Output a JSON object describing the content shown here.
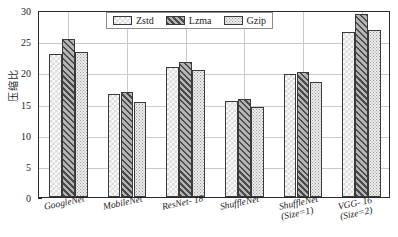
{
  "chart_data": {
    "type": "bar",
    "title": "",
    "xlabel": "",
    "ylabel": "压缩比",
    "ylim": [
      0,
      30
    ],
    "yticks": [
      0,
      5,
      10,
      15,
      20,
      25,
      30
    ],
    "grid": true,
    "legend_position": "top-center",
    "categories": [
      "GoogleNet",
      "MobileNet",
      "ResNet-18",
      "ShuffleNet",
      "ShuffleNet (Size=1)",
      "VGG-16 (Size=2)"
    ],
    "category_lines": [
      [
        "GoogleNet",
        ""
      ],
      [
        "MobileNet",
        ""
      ],
      [
        "ResNet- 18",
        ""
      ],
      [
        "ShuffleNet",
        ""
      ],
      [
        "ShuffleNet",
        "(Size=1)"
      ],
      [
        "VGG- 16",
        "(Size=2)"
      ]
    ],
    "series": [
      {
        "name": "Zstd",
        "pattern": "checker-light",
        "color": "#dcdcdc",
        "values": [
          23.0,
          16.6,
          20.8,
          15.4,
          19.8,
          26.5
        ]
      },
      {
        "name": "Lzma",
        "pattern": "diagonal-hatch-dark",
        "color": "#8e8e8e",
        "values": [
          25.3,
          16.9,
          21.7,
          15.8,
          20.0,
          29.4
        ]
      },
      {
        "name": "Gzip",
        "pattern": "dots-fine",
        "color": "#ededed",
        "values": [
          23.3,
          15.3,
          20.3,
          14.5,
          18.4,
          26.8
        ]
      }
    ]
  },
  "legend": {
    "items": [
      {
        "label": "Zstd"
      },
      {
        "label": "Lzma"
      },
      {
        "label": "Gzip"
      }
    ]
  },
  "axis": {
    "y_title": "压缩比",
    "y_tick_labels": [
      "0",
      "5",
      "10",
      "15",
      "20",
      "25",
      "30"
    ]
  }
}
